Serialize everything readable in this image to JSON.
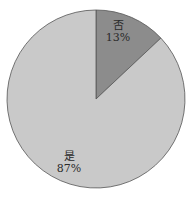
{
  "chart_data": {
    "type": "pie",
    "title": "",
    "categories": [
      "否",
      "是"
    ],
    "values": [
      13,
      87
    ],
    "labels": [
      "否\n13%",
      "是\n87%"
    ],
    "percent_labels": [
      "13%",
      "87%"
    ],
    "start_angle_deg": 0,
    "direction": "clockwise",
    "colors": [
      "#8c8c8c",
      "#c9c9c9"
    ],
    "outline_color": "#555555",
    "legend": "none"
  },
  "slices": [
    {
      "name": "否",
      "percent": "13%"
    },
    {
      "name": "是",
      "percent": "87%"
    }
  ]
}
